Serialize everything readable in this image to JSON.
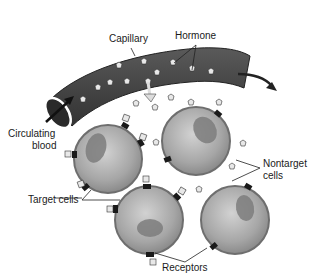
{
  "diagram": {
    "type": "biology-illustration",
    "labels": {
      "capillary": "Capillary",
      "hormone": "Hormone",
      "circulating_blood_line1": "Circulating",
      "circulating_blood_line2": "blood",
      "nontarget_cells_line1": "Nontarget",
      "nontarget_cells_line2": "cells",
      "target_cells": "Target cells",
      "receptors": "Receptors"
    },
    "cells": [
      {
        "id": "cell-top-left",
        "role": "target",
        "cx": 108,
        "cy": 159,
        "r": 34
      },
      {
        "id": "cell-top-right",
        "role": "nontarget",
        "cx": 196,
        "cy": 141,
        "r": 34
      },
      {
        "id": "cell-bottom-left",
        "role": "target",
        "cx": 149,
        "cy": 220,
        "r": 34
      },
      {
        "id": "cell-bottom-right",
        "role": "nontarget",
        "cx": 235,
        "cy": 220,
        "r": 34
      }
    ],
    "colors": {
      "capillary": "#4a4a4a",
      "cell_fill": "#a8a8a8",
      "cell_edge": "#6e6e6e",
      "nucleus": "#7c7c7c",
      "receptor": "#1a1a1a",
      "hormone": "#e8e8e8"
    }
  }
}
